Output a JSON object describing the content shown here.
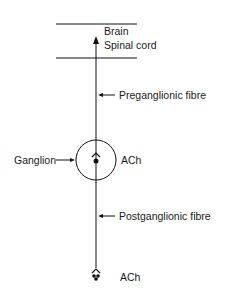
{
  "diagram": {
    "cns": {
      "line1": "Brain",
      "line2": "Spinal  cord"
    },
    "labels": {
      "preganglionic": "Preganglionic fibre",
      "ganglion": "Ganglion",
      "ganglion_transmitter": "ACh",
      "postganglionic": "Postganglionic fibre",
      "effector_transmitter": "ACh"
    },
    "colors": {
      "ink": "#111111",
      "background": "#ffffff"
    }
  }
}
